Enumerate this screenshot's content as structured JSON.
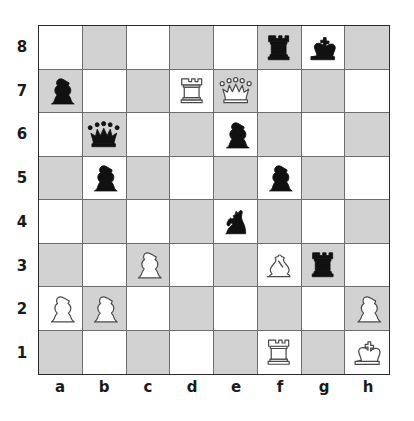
{
  "board": {
    "title": "Chess position diagram",
    "orientation": "white-bottom",
    "light_square_color": "#ffffff",
    "dark_square_color": "#d2d2d2",
    "border_color": "#2b2b2b",
    "grid_line_color": "#6d6d6d",
    "white_piece_fill": "#ffffff",
    "white_piece_stroke": "#4a4a4a",
    "black_piece_fill": "#111111",
    "files": [
      "a",
      "b",
      "c",
      "d",
      "e",
      "f",
      "g",
      "h"
    ],
    "ranks": [
      "8",
      "7",
      "6",
      "5",
      "4",
      "3",
      "2",
      "1"
    ],
    "fen": "5rk1/p2RQ3/1q2p3/1p3p2/4n3/2P2Br1/PP5P/5R1K",
    "squares": [
      [
        null,
        null,
        null,
        null,
        null,
        {
          "color": "black",
          "type": "rook",
          "square": "f8"
        },
        {
          "color": "black",
          "type": "king",
          "square": "g8"
        },
        null
      ],
      [
        {
          "color": "black",
          "type": "pawn",
          "square": "a7"
        },
        null,
        null,
        {
          "color": "white",
          "type": "rook",
          "square": "d7"
        },
        {
          "color": "white",
          "type": "queen",
          "square": "e7"
        },
        null,
        null,
        null
      ],
      [
        null,
        {
          "color": "black",
          "type": "queen",
          "square": "b6"
        },
        null,
        null,
        {
          "color": "black",
          "type": "pawn",
          "square": "e6"
        },
        null,
        null,
        null
      ],
      [
        null,
        {
          "color": "black",
          "type": "pawn",
          "square": "b5"
        },
        null,
        null,
        null,
        {
          "color": "black",
          "type": "pawn",
          "square": "f5"
        },
        null,
        null
      ],
      [
        null,
        null,
        null,
        null,
        {
          "color": "black",
          "type": "knight",
          "square": "e4"
        },
        null,
        null,
        null
      ],
      [
        null,
        null,
        {
          "color": "white",
          "type": "pawn",
          "square": "c3"
        },
        null,
        null,
        {
          "color": "white",
          "type": "bishop",
          "square": "f3"
        },
        {
          "color": "black",
          "type": "rook",
          "square": "g3"
        },
        null
      ],
      [
        {
          "color": "white",
          "type": "pawn",
          "square": "a2"
        },
        {
          "color": "white",
          "type": "pawn",
          "square": "b2"
        },
        null,
        null,
        null,
        null,
        null,
        {
          "color": "white",
          "type": "pawn",
          "square": "h2"
        }
      ],
      [
        null,
        null,
        null,
        null,
        null,
        {
          "color": "white",
          "type": "rook",
          "square": "f1"
        },
        null,
        {
          "color": "white",
          "type": "king",
          "square": "h1"
        }
      ]
    ]
  }
}
